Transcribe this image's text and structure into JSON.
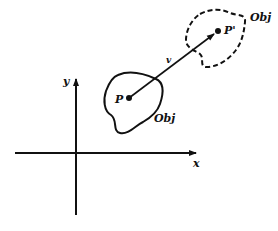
{
  "diagram": {
    "type": "translation-of-object",
    "colors": {
      "ink": "#111111",
      "background": "#ffffff"
    },
    "axes": {
      "x_label": "x",
      "y_label": "y"
    },
    "original_object": {
      "label": "Obj",
      "point_label": "P",
      "outline": "solid"
    },
    "translated_object": {
      "label": "Obj",
      "point_label": "P'",
      "outline": "dashed"
    },
    "translation_vector": {
      "label": "v",
      "from": "P",
      "to": "P'"
    }
  }
}
